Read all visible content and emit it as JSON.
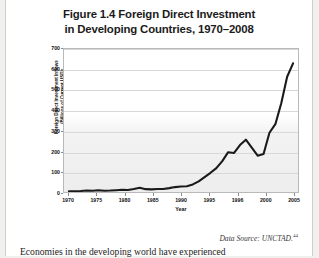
{
  "page": {
    "background": "#ffffff",
    "title_line1": "Figure 1.4 Foreign Direct Investment",
    "title_line2": "in Developing Countries, 1970–2008",
    "source_text": "Data Source: UNCTAD.",
    "source_footnote": "44",
    "body_text": "Economies in the developing world have experienced"
  },
  "chart_data": {
    "type": "line",
    "title": "Figure 1.4 Foreign Direct Investment in Developing Countries, 1970–2008",
    "xlabel": "Year",
    "ylabel_line1": "Foreign Direct Investment Inflows",
    "ylabel_line2": "(Billions of Current USD)",
    "ylim": [
      0,
      700
    ],
    "yticks": [
      0,
      100,
      200,
      300,
      400,
      500,
      600,
      700
    ],
    "xtick_labels": [
      "1970",
      "1975",
      "1980",
      "1985",
      "1990",
      "1995",
      "1996",
      "2000",
      "2005"
    ],
    "xlim": [
      1970,
      2008
    ],
    "grid": true,
    "legend": "none",
    "line_color": "#1a1a1a",
    "x": [
      1970,
      1971,
      1972,
      1973,
      1974,
      1975,
      1976,
      1977,
      1978,
      1979,
      1980,
      1981,
      1982,
      1983,
      1984,
      1985,
      1986,
      1987,
      1988,
      1989,
      1990,
      1991,
      1992,
      1993,
      1994,
      1995,
      1996,
      1997,
      1998,
      1999,
      2000,
      2001,
      2002,
      2003,
      2004,
      2005,
      2006,
      2007,
      2008
    ],
    "values": [
      4,
      4,
      5,
      7,
      6,
      9,
      6,
      7,
      9,
      11,
      10,
      15,
      21,
      14,
      13,
      15,
      15,
      19,
      24,
      27,
      28,
      37,
      52,
      73,
      94,
      117,
      151,
      195,
      191,
      230,
      256,
      217,
      178,
      186,
      290,
      332,
      434,
      564,
      630
    ],
    "annotations": []
  }
}
